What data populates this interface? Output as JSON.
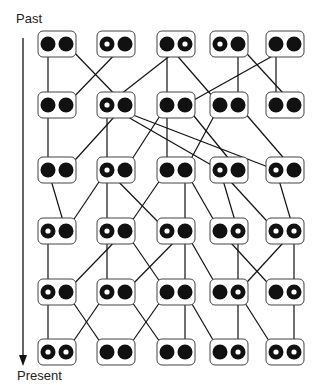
{
  "labels": {
    "top": "Past",
    "bottom": "Present"
  },
  "colors": {
    "ink": "#111111",
    "box_stroke": "#444444",
    "background": "#ffffff"
  },
  "layout": {
    "box_x": [
      38,
      97,
      157,
      210,
      266
    ],
    "row_y": [
      44,
      105,
      170,
      231,
      292,
      352
    ],
    "box_w": 38,
    "box_h": 26,
    "left_offset": 10,
    "right_offset": 28,
    "r": 7.5
  },
  "rows": [
    [
      [
        "F",
        "F"
      ],
      [
        "R",
        "F"
      ],
      [
        "F",
        "R"
      ],
      [
        "R",
        "F"
      ],
      [
        "F",
        "F"
      ]
    ],
    [
      [
        "F",
        "F"
      ],
      [
        "R",
        "F"
      ],
      [
        "F",
        "F"
      ],
      [
        "F",
        "F"
      ],
      [
        "F",
        "F"
      ]
    ],
    [
      [
        "F",
        "F"
      ],
      [
        "R",
        "F"
      ],
      [
        "F",
        "F"
      ],
      [
        "R",
        "F"
      ],
      [
        "R",
        "F"
      ]
    ],
    [
      [
        "R",
        "F"
      ],
      [
        "R",
        "F"
      ],
      [
        "R",
        "F"
      ],
      [
        "F",
        "R"
      ],
      [
        "R",
        "R"
      ]
    ],
    [
      [
        "R",
        "F"
      ],
      [
        "R",
        "F"
      ],
      [
        "F",
        "F"
      ],
      [
        "F",
        "R"
      ],
      [
        "F",
        "R"
      ]
    ],
    [
      [
        "R",
        "R"
      ],
      [
        "F",
        "F"
      ],
      [
        "F",
        "F"
      ],
      [
        "F",
        "R"
      ],
      [
        "R",
        "R"
      ]
    ]
  ],
  "edges": [
    [
      [
        0,
        0,
        0,
        0
      ],
      [
        0,
        1,
        1,
        1
      ],
      [
        1,
        1,
        0,
        1
      ],
      [
        2,
        1,
        1,
        0
      ],
      [
        2,
        0,
        2,
        0
      ],
      [
        2,
        0,
        3,
        0
      ],
      [
        3,
        1,
        3,
        1
      ],
      [
        3,
        1,
        4,
        1
      ],
      [
        4,
        1,
        2,
        1
      ],
      [
        4,
        0,
        4,
        0
      ]
    ],
    [
      [
        0,
        0,
        0,
        0
      ],
      [
        1,
        1,
        0,
        1
      ],
      [
        1,
        0,
        1,
        0
      ],
      [
        1,
        0,
        3,
        0
      ],
      [
        1,
        0,
        4,
        0
      ],
      [
        2,
        0,
        2,
        0
      ],
      [
        2,
        0,
        1,
        1
      ],
      [
        2,
        1,
        3,
        1
      ],
      [
        3,
        0,
        2,
        1
      ],
      [
        3,
        1,
        4,
        1
      ]
    ],
    [
      [
        0,
        0,
        0,
        1
      ],
      [
        1,
        0,
        0,
        1
      ],
      [
        1,
        0,
        1,
        0
      ],
      [
        1,
        0,
        2,
        0
      ],
      [
        2,
        0,
        1,
        1
      ],
      [
        2,
        1,
        2,
        1
      ],
      [
        2,
        1,
        3,
        0
      ],
      [
        3,
        0,
        3,
        1
      ],
      [
        3,
        0,
        4,
        0
      ],
      [
        4,
        0,
        4,
        1
      ]
    ],
    [
      [
        0,
        0,
        0,
        0
      ],
      [
        1,
        1,
        0,
        1
      ],
      [
        1,
        0,
        1,
        0
      ],
      [
        1,
        1,
        2,
        0
      ],
      [
        2,
        1,
        1,
        1
      ],
      [
        2,
        1,
        2,
        1
      ],
      [
        2,
        1,
        3,
        0
      ],
      [
        3,
        1,
        3,
        1
      ],
      [
        3,
        0,
        4,
        0
      ],
      [
        4,
        1,
        3,
        1
      ],
      [
        4,
        1,
        4,
        1
      ]
    ],
    [
      [
        0,
        0,
        0,
        0
      ],
      [
        0,
        1,
        1,
        0
      ],
      [
        1,
        0,
        0,
        1
      ],
      [
        1,
        1,
        2,
        0
      ],
      [
        2,
        0,
        1,
        1
      ],
      [
        2,
        1,
        2,
        1
      ],
      [
        2,
        1,
        3,
        0
      ],
      [
        3,
        1,
        3,
        1
      ],
      [
        3,
        1,
        4,
        0
      ],
      [
        4,
        1,
        4,
        1
      ]
    ]
  ]
}
